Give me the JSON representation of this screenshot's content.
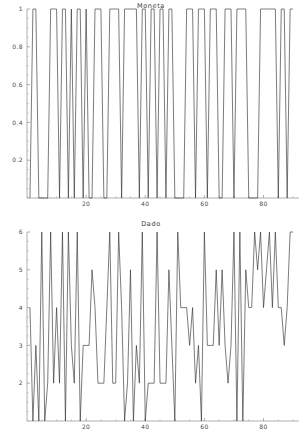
{
  "page": {
    "background": "#ffffff",
    "line_color": "#2b2b2b",
    "axis_color": "#7a7a7a",
    "text_color": "#4a4a4a"
  },
  "figures": [
    {
      "id": "moneta",
      "title": "Moneta"
    },
    {
      "id": "dado",
      "title": "Dado"
    }
  ],
  "chart_data": [
    {
      "type": "line",
      "title": "Moneta",
      "xlabel": "",
      "ylabel": "",
      "grid": false,
      "legend": null,
      "xlim": [
        0,
        92
      ],
      "ylim": [
        0,
        1
      ],
      "xticks": [
        20,
        40,
        60,
        80
      ],
      "xtick_labels": [
        "20",
        "40",
        "60",
        "80"
      ],
      "yticks": [
        0.2,
        0.4,
        0.6,
        0.8,
        1
      ],
      "ytick_labels": [
        "0.2",
        "0.4",
        "0.6",
        "0.8",
        "1"
      ],
      "x": [
        1,
        2,
        3,
        4,
        5,
        6,
        7,
        8,
        9,
        10,
        11,
        12,
        13,
        14,
        15,
        16,
        17,
        18,
        19,
        20,
        21,
        22,
        23,
        24,
        25,
        26,
        27,
        28,
        29,
        30,
        31,
        32,
        33,
        34,
        35,
        36,
        37,
        38,
        39,
        40,
        41,
        42,
        43,
        44,
        45,
        46,
        47,
        48,
        49,
        50,
        51,
        52,
        53,
        54,
        55,
        56,
        57,
        58,
        59,
        60,
        61,
        62,
        63,
        64,
        65,
        66,
        67,
        68,
        69,
        70,
        71,
        72,
        73,
        74,
        75,
        76,
        77,
        78,
        79,
        80,
        81,
        82,
        83,
        84,
        85,
        86,
        87,
        88,
        89,
        90
      ],
      "values": [
        0,
        1,
        1,
        0,
        0,
        0,
        0,
        1,
        1,
        1,
        0,
        1,
        1,
        0,
        1,
        0,
        1,
        1,
        0,
        1,
        0,
        0,
        1,
        1,
        1,
        0,
        0,
        1,
        1,
        1,
        1,
        0,
        1,
        1,
        1,
        1,
        1,
        0,
        1,
        1,
        0,
        1,
        1,
        0,
        1,
        1,
        0,
        1,
        1,
        0,
        0,
        0,
        0,
        1,
        1,
        1,
        0,
        1,
        1,
        1,
        0,
        1,
        1,
        1,
        0,
        0,
        1,
        1,
        1,
        0,
        1,
        1,
        1,
        1,
        0,
        0,
        0,
        0,
        1,
        1,
        1,
        1,
        1,
        1,
        0,
        1,
        1,
        0,
        1,
        1
      ]
    },
    {
      "type": "line",
      "title": "Dado",
      "xlabel": "",
      "ylabel": "",
      "grid": false,
      "legend": null,
      "xlim": [
        0,
        92
      ],
      "ylim": [
        1,
        6
      ],
      "xticks": [
        20,
        40,
        60,
        80
      ],
      "xtick_labels": [
        "20",
        "40",
        "60",
        "80"
      ],
      "yticks": [
        2,
        3,
        4,
        5,
        6
      ],
      "ytick_labels": [
        "2",
        "3",
        "4",
        "5",
        "6"
      ],
      "x": [
        1,
        2,
        3,
        4,
        5,
        6,
        7,
        8,
        9,
        10,
        11,
        12,
        13,
        14,
        15,
        16,
        17,
        18,
        19,
        20,
        21,
        22,
        23,
        24,
        25,
        26,
        27,
        28,
        29,
        30,
        31,
        32,
        33,
        34,
        35,
        36,
        37,
        38,
        39,
        40,
        41,
        42,
        43,
        44,
        45,
        46,
        47,
        48,
        49,
        50,
        51,
        52,
        53,
        54,
        55,
        56,
        57,
        58,
        59,
        60,
        61,
        62,
        63,
        64,
        65,
        66,
        67,
        68,
        69,
        70,
        71,
        72,
        73,
        74,
        75,
        76,
        77,
        78,
        79,
        80,
        81,
        82,
        83,
        84,
        85,
        86,
        87,
        88,
        89,
        90
      ],
      "values": [
        4,
        1,
        3,
        1,
        6,
        1,
        2,
        6,
        2,
        4,
        2,
        6,
        1,
        6,
        3,
        2,
        6,
        1,
        3,
        3,
        3,
        5,
        4,
        2,
        2,
        2,
        4,
        6,
        2,
        2,
        6,
        4,
        1,
        2,
        5,
        1,
        3,
        2,
        6,
        1,
        2,
        2,
        2,
        6,
        2,
        2,
        2,
        5,
        3,
        1,
        6,
        4,
        4,
        4,
        3,
        4,
        2,
        3,
        1,
        6,
        3,
        3,
        3,
        5,
        3,
        5,
        3,
        2,
        3,
        6,
        1,
        6,
        1,
        5,
        4,
        4,
        6,
        5,
        6,
        4,
        5,
        6,
        4,
        6,
        4,
        4,
        3,
        4,
        6,
        6
      ]
    }
  ]
}
